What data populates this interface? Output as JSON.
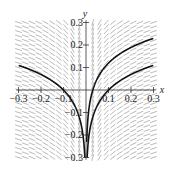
{
  "chart_data": {
    "type": "line",
    "title": "",
    "subtitle": "Slope field with solution curves",
    "xlabel": "x",
    "ylabel": "y",
    "xlim": [
      -0.3,
      0.3
    ],
    "ylim": [
      -0.3,
      0.3
    ],
    "x_ticks": [
      -0.3,
      -0.2,
      -0.1,
      0.1,
      0.2,
      0.3
    ],
    "x_tick_labels": [
      "−0.3",
      "−0.2",
      "−0.1",
      "0.1",
      "0.2",
      "0.3"
    ],
    "y_ticks": [
      0.3,
      0.2,
      0.1,
      -0.1,
      -0.2,
      -0.3
    ],
    "y_tick_labels": [
      "0.3",
      "0.2",
      "0.1",
      "−0.1",
      "−0.2",
      "−0.3"
    ],
    "grid": false,
    "slope_field": {
      "equation": "dy/dx = 0.1/x",
      "color": "#a8a8a8"
    },
    "series": [
      {
        "name": "upper right solution",
        "x": [
          0.02,
          0.03,
          0.05,
          0.1,
          0.15,
          0.2,
          0.25,
          0.3
        ],
        "y": [
          -0.04,
          0.0,
          0.05,
          0.12,
          0.16,
          0.19,
          0.21,
          0.23
        ]
      },
      {
        "name": "lower right solution",
        "x": [
          0.005,
          0.01,
          0.02,
          0.05,
          0.1,
          0.15,
          0.2,
          0.25,
          0.3
        ],
        "y": [
          -0.3,
          -0.23,
          -0.16,
          -0.07,
          0.0,
          0.04,
          0.07,
          0.09,
          0.11
        ]
      },
      {
        "name": "left solution",
        "x": [
          -0.3,
          -0.25,
          -0.2,
          -0.15,
          -0.1,
          -0.05,
          -0.02,
          -0.01,
          -0.005
        ],
        "y": [
          0.11,
          0.09,
          0.07,
          0.04,
          0.0,
          -0.07,
          -0.16,
          -0.23,
          -0.3
        ]
      }
    ],
    "line_color": "#111111"
  }
}
